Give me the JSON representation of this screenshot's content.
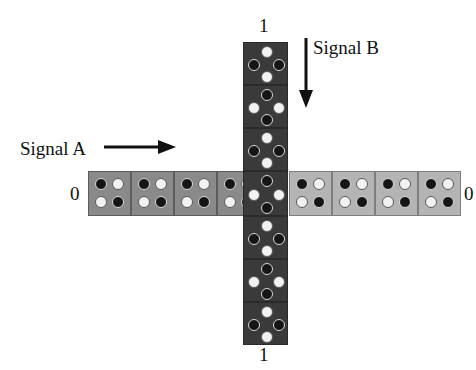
{
  "figure": {
    "labels": {
      "top_bit": "1",
      "bottom_bit": "1",
      "left_bit": "0",
      "right_bit": "0",
      "signal_a": "Signal A",
      "signal_b": "Signal B"
    },
    "colors": {
      "background": "#ffffff",
      "cell_dark": "#3a3a3a",
      "cell_medium": "#8a8a8a",
      "cell_light": "#b4b4b4",
      "dot_black": "#151515",
      "dot_white": "#f2f2f2",
      "text": "#111111",
      "arrow": "#111111"
    },
    "horizontal_row": {
      "orientation": "horizontal",
      "cell_count": 9,
      "pattern_layout": "2x2-square",
      "left_label": "0",
      "right_label": "0",
      "cells": [
        {
          "index": 0,
          "shade": "medium",
          "dots": [
            "black",
            "white",
            "white",
            "black"
          ]
        },
        {
          "index": 1,
          "shade": "medium",
          "dots": [
            "black",
            "white",
            "white",
            "black"
          ]
        },
        {
          "index": 2,
          "shade": "medium",
          "dots": [
            "black",
            "white",
            "white",
            "black"
          ]
        },
        {
          "index": 3,
          "shade": "medium",
          "dots": [
            "black",
            "white",
            "white",
            "black"
          ]
        },
        {
          "index": 4,
          "shade": "dark",
          "dots": [
            "black",
            "white",
            "white",
            "black"
          ],
          "is_center": true
        },
        {
          "index": 5,
          "shade": "light",
          "dots": [
            "black",
            "white",
            "white",
            "black"
          ]
        },
        {
          "index": 6,
          "shade": "light",
          "dots": [
            "black",
            "white",
            "white",
            "black"
          ]
        },
        {
          "index": 7,
          "shade": "light",
          "dots": [
            "black",
            "white",
            "white",
            "black"
          ]
        },
        {
          "index": 8,
          "shade": "light",
          "dots": [
            "black",
            "white",
            "white",
            "black"
          ]
        }
      ]
    },
    "vertical_column": {
      "orientation": "vertical",
      "cell_count": 7,
      "pattern_layout": "diamond",
      "top_label": "1",
      "bottom_label": "1",
      "cells": [
        {
          "index": 0,
          "shade": "dark",
          "dots": [
            "white",
            "black",
            "black",
            "white"
          ]
        },
        {
          "index": 1,
          "shade": "dark",
          "dots": [
            "black",
            "white",
            "white",
            "black"
          ]
        },
        {
          "index": 2,
          "shade": "dark",
          "dots": [
            "white",
            "black",
            "black",
            "white"
          ]
        },
        {
          "index": 3,
          "shade": "dark",
          "dots": [
            "black",
            "white",
            "white",
            "black"
          ],
          "is_center": true
        },
        {
          "index": 4,
          "shade": "dark",
          "dots": [
            "white",
            "black",
            "black",
            "white"
          ]
        },
        {
          "index": 5,
          "shade": "dark",
          "dots": [
            "black",
            "white",
            "white",
            "black"
          ]
        },
        {
          "index": 6,
          "shade": "dark",
          "dots": [
            "white",
            "black",
            "black",
            "white"
          ]
        }
      ]
    },
    "arrows": [
      {
        "name": "signal-a-arrow",
        "direction": "right",
        "label": "Signal A"
      },
      {
        "name": "signal-b-arrow",
        "direction": "down",
        "label": "Signal B"
      }
    ]
  }
}
